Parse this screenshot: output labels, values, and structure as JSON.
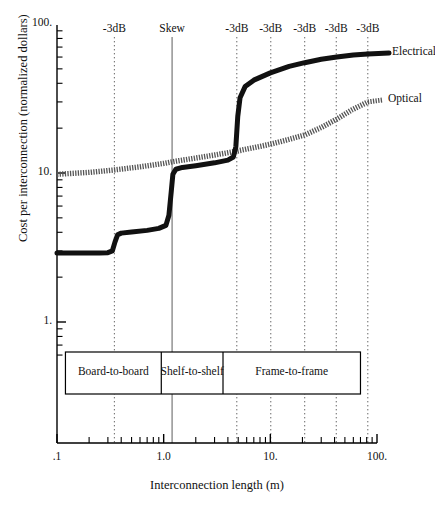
{
  "chart_data": {
    "type": "line",
    "title": "",
    "xlabel": "Interconnection length (m)",
    "ylabel": "Cost per interconnection (normalized dollars)",
    "xscale": "log",
    "yscale": "log",
    "xlim": [
      0.1,
      100
    ],
    "ylim": [
      0.55,
      100
    ],
    "xticks": [
      0.1,
      1.0,
      10.0,
      100.0
    ],
    "xticklabels": [
      ".1",
      "1.0",
      "10.",
      "100."
    ],
    "yticks": [
      1,
      10,
      100
    ],
    "yticklabels": [
      "1.",
      "10.",
      "100."
    ],
    "grid": false,
    "legend_position": "right-of-curve-ends",
    "series": [
      {
        "name": "Electrical",
        "style": "thick-black-stepped",
        "points": [
          [
            0.1,
            2.9
          ],
          [
            0.15,
            2.9
          ],
          [
            0.2,
            2.9
          ],
          [
            0.25,
            2.9
          ],
          [
            0.3,
            2.92
          ],
          [
            0.33,
            3.0
          ],
          [
            0.35,
            3.45
          ],
          [
            0.37,
            3.85
          ],
          [
            0.4,
            3.95
          ],
          [
            0.5,
            4.02
          ],
          [
            0.7,
            4.12
          ],
          [
            0.9,
            4.25
          ],
          [
            1.05,
            4.45
          ],
          [
            1.12,
            5.2
          ],
          [
            1.18,
            7.6
          ],
          [
            1.22,
            9.8
          ],
          [
            1.3,
            10.6
          ],
          [
            1.5,
            10.9
          ],
          [
            2.0,
            11.2
          ],
          [
            3.0,
            11.7
          ],
          [
            4.0,
            12.2
          ],
          [
            4.5,
            12.8
          ],
          [
            4.75,
            15.0
          ],
          [
            4.95,
            24.0
          ],
          [
            5.2,
            32.0
          ],
          [
            5.8,
            38.0
          ],
          [
            7.0,
            42.0
          ],
          [
            10.0,
            47.0
          ],
          [
            15.0,
            52.0
          ],
          [
            21.0,
            55.0
          ],
          [
            30.0,
            58.0
          ],
          [
            42.0,
            60.0
          ],
          [
            60.0,
            62.0
          ],
          [
            82.0,
            63.0
          ]
        ]
      },
      {
        "name": "Optical",
        "style": "hatched-gray",
        "points": [
          [
            0.1,
            9.8
          ],
          [
            0.2,
            10.1
          ],
          [
            0.35,
            10.5
          ],
          [
            0.6,
            11.0
          ],
          [
            1.0,
            11.6
          ],
          [
            1.2,
            11.9
          ],
          [
            2.0,
            12.6
          ],
          [
            3.0,
            13.2
          ],
          [
            4.8,
            14.0
          ],
          [
            7.0,
            14.8
          ],
          [
            10.0,
            15.6
          ],
          [
            14.0,
            16.6
          ],
          [
            21.0,
            18.0
          ],
          [
            30.0,
            20.2
          ],
          [
            42.0,
            23.0
          ],
          [
            58.0,
            26.5
          ],
          [
            82.0,
            30.0
          ]
        ]
      }
    ],
    "annotations": {
      "vertical_markers": [
        {
          "x": 0.345,
          "label": "-3dB",
          "style": "dotted"
        },
        {
          "x": 1.2,
          "label": "Skew",
          "style": "solid-gray"
        },
        {
          "x": 4.85,
          "label": "-3dB",
          "style": "dotted"
        },
        {
          "x": 10.1,
          "label": "-3dB",
          "style": "dotted"
        },
        {
          "x": 21.0,
          "label": "-3dB",
          "style": "dotted"
        },
        {
          "x": 41.5,
          "label": "-3dB",
          "style": "dotted"
        },
        {
          "x": 82.0,
          "label": "-3dB",
          "style": "dotted"
        }
      ],
      "segment_boxes": [
        {
          "label": "Board-to-board",
          "x_start": 0.12,
          "x_end": 0.95
        },
        {
          "label": "Shelf-to-shelf",
          "x_start": 0.95,
          "x_end": 3.6
        },
        {
          "label": "Frame-to-frame",
          "x_start": 3.6,
          "x_end": 70.0
        }
      ]
    }
  },
  "labels": {
    "ylabel": "Cost per interconnection (normalized dollars)",
    "xlabel": "Interconnection length (m)",
    "y_tick_100": "100.",
    "y_tick_10": "10.",
    "y_tick_1": "1.",
    "x_tick_01": ".1",
    "x_tick_1": "1.0",
    "x_tick_10": "10.",
    "x_tick_100": "100.",
    "marker_1": "-3dB",
    "marker_2": "Skew",
    "marker_3": "-3dB",
    "marker_4": "-3dB",
    "marker_5": "-3dB",
    "marker_6": "-3dB",
    "marker_7": "-3dB",
    "series_electrical": "Electrical",
    "series_optical": "Optical",
    "segment_1": "Board-to-board",
    "segment_2": "Shelf-to-shelf",
    "segment_3": "Frame-to-frame"
  },
  "colors": {
    "axis": "#000000",
    "electrical": "#111111",
    "optical": "#555555",
    "marker_dotted": "#666666",
    "marker_solid": "#999999",
    "background": "#ffffff"
  }
}
